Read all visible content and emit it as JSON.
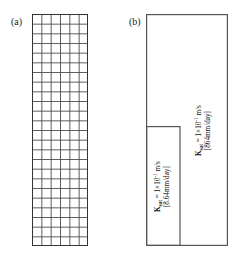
{
  "figure": {
    "panels": [
      {
        "id": "a",
        "label": "(a)",
        "type": "finite-element-mesh",
        "geometry": {
          "x": 32,
          "y": 14,
          "width": 56,
          "height": 232
        },
        "mesh": {
          "columns": 6,
          "rows": 24,
          "line_color": "#4d4d4d",
          "border_color": "#333333"
        }
      },
      {
        "id": "b",
        "label": "(b)",
        "type": "two-zone-block",
        "geometry": {
          "x": 146,
          "y": 14,
          "width": 82,
          "height": 232
        },
        "border_color": "#555555",
        "zones": [
          {
            "name": "upper-zone",
            "geometry": {
              "x": 180,
              "y": 14,
              "width": 48,
              "height": 232
            },
            "label": {
              "symbol": "K",
              "subscript": "sat",
              "equals": "=",
              "value": "1×10",
              "exponent": "-1",
              "unit": "m/s",
              "bracket": "[864mm/day]"
            }
          },
          {
            "name": "lower-left-zone",
            "geometry": {
              "x": 146,
              "y": 126,
              "width": 34,
              "height": 120
            },
            "label": {
              "symbol": "K",
              "subscript": "sat",
              "equals": "=",
              "value": "1×10",
              "exponent": "-1",
              "unit": "m/s",
              "bracket": "[8.64mm/day]"
            }
          }
        ]
      }
    ]
  },
  "colors": {
    "background": "#ffffff",
    "mesh_line": "#4d4d4d",
    "outline": "#555555",
    "text": "#111111"
  }
}
